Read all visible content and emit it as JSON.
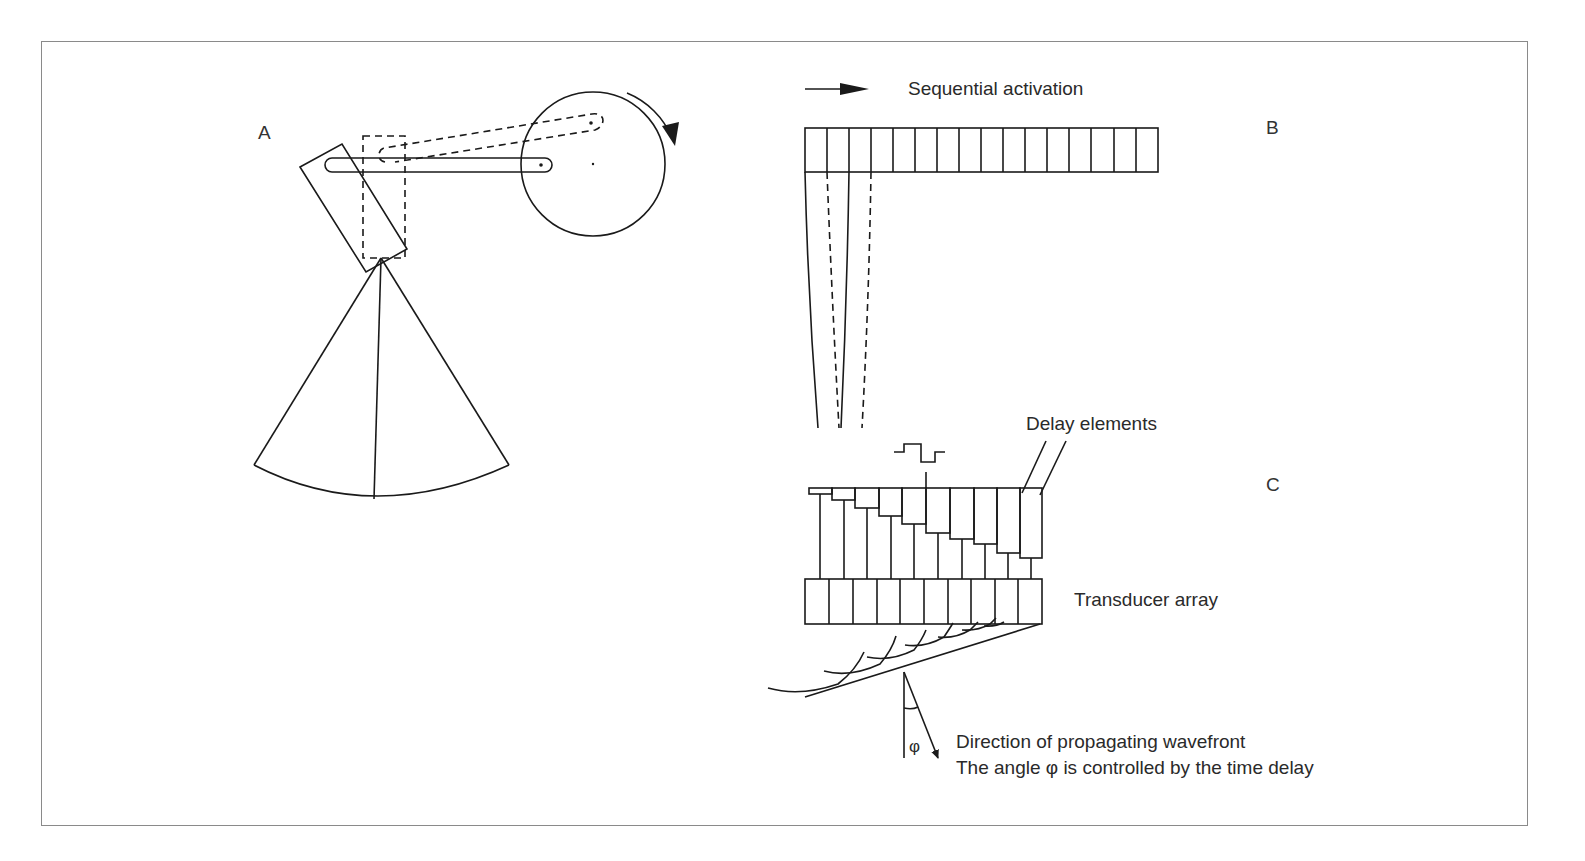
{
  "figure": {
    "panels": [
      {
        "id": "A",
        "label": "A",
        "description": "Mechanical sector scanner: rotating wheel drives a crank arm that oscillates a transducer, sweeping a sector beam"
      },
      {
        "id": "B",
        "label": "B",
        "description": "Linear array with sequential activation"
      },
      {
        "id": "C",
        "label": "C",
        "description": "Phased array with delay elements steering the wavefront"
      }
    ],
    "labels": {
      "panel_a": "A",
      "panel_b": "B",
      "panel_c": "C",
      "sequential_activation": "Sequential activation",
      "delay_elements": "Delay elements",
      "transducer_array": "Transducer array",
      "direction_line1": "Direction of propagating wavefront",
      "direction_line2": "The angle φ is controlled by the time delay",
      "phi": "φ"
    },
    "linear_array": {
      "element_count": 16
    },
    "phased_array": {
      "element_count": 10,
      "delay_element_count": 10
    },
    "colors": {
      "stroke": "#1a1a1a",
      "text": "#2a2a2a",
      "frame": "#8a8a8a",
      "background": "#ffffff"
    }
  }
}
